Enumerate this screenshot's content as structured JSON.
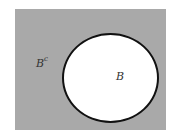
{
  "diagram": {
    "type": "venn",
    "universe_fill": "#a9a9a9",
    "set": {
      "label": "B",
      "fill": "#ffffff",
      "stroke": "#111111"
    },
    "complement": {
      "label_base": "B",
      "label_sup": "c"
    }
  }
}
